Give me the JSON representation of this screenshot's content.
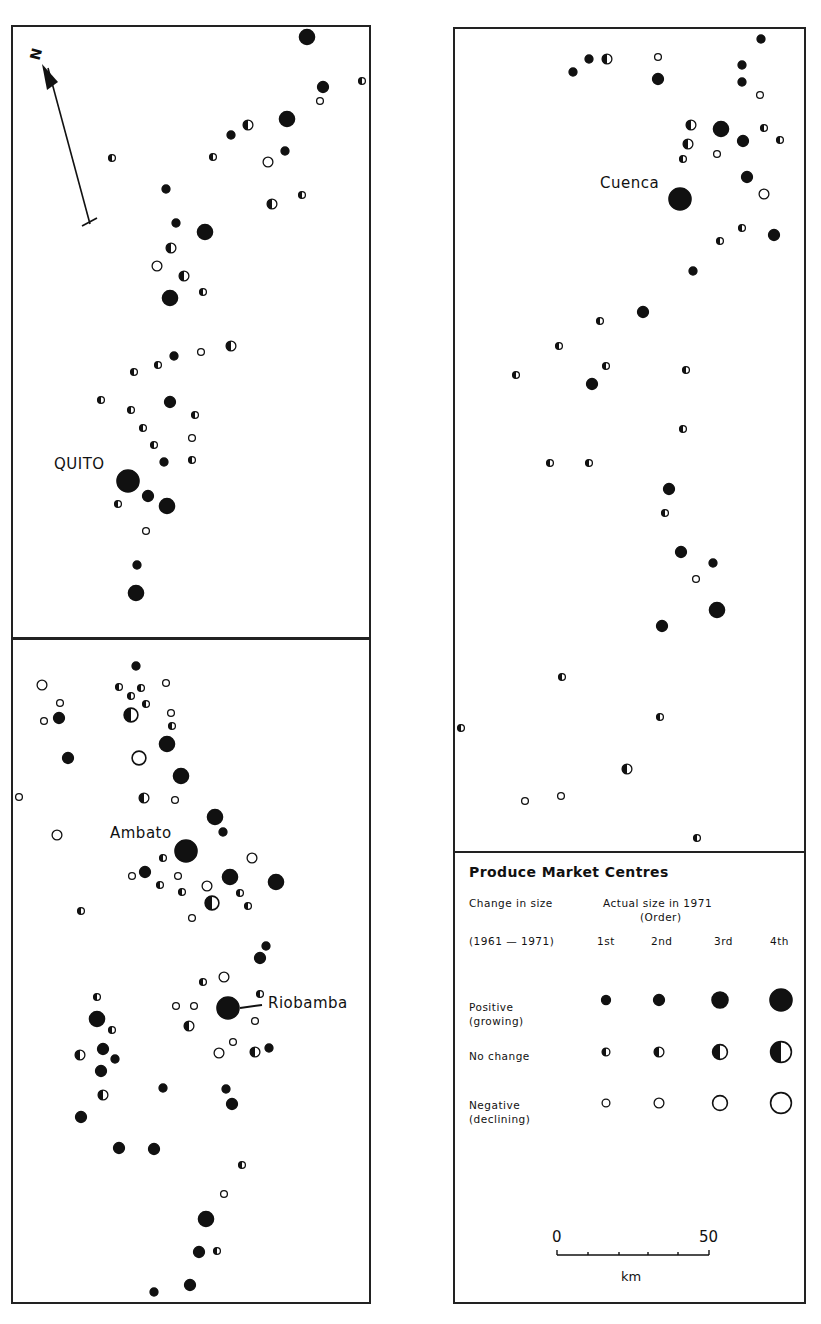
{
  "header": {
    "running_title": "ORIGINS, DEVELOPMENT AND CHANGE"
  },
  "map": {
    "north_label": "N",
    "cities": {
      "quito": "QUITO",
      "cuenca": "Cuenca",
      "ambato": "Ambato",
      "riobamba": "Riobamba"
    }
  },
  "legend": {
    "title": "Produce Market Centres",
    "change_header": "Change in size",
    "period": "(1961 — 1971)",
    "size_header": "Actual size in 1971",
    "size_subheader": "(Order)",
    "orders": [
      "1st",
      "2nd",
      "3rd",
      "4th"
    ],
    "rows": [
      {
        "label": "Positive",
        "sublabel": "(growing)",
        "type": "P"
      },
      {
        "label": "No change",
        "sublabel": "",
        "type": "N"
      },
      {
        "label": "Negative",
        "sublabel": "(declining)",
        "type": "D"
      }
    ],
    "scale": {
      "start": "0",
      "end": "50",
      "unit": "km"
    }
  },
  "colors": {
    "ink": "#111111",
    "paper": "#ffffff",
    "frame": "#222222"
  },
  "chart_data": {
    "type": "scatter",
    "title": "Produce Market Centres",
    "legend_position": "bottom-right panel",
    "encoding": {
      "marker_fill": {
        "P": "Positive (growing)",
        "N": "No change",
        "D": "Negative (declining)"
      },
      "marker_size": {
        "1": "1st order",
        "2": "2nd order",
        "3": "3rd order",
        "4": "4th order"
      }
    },
    "labels": [
      {
        "text": "QUITO",
        "x": 128,
        "y": 481
      },
      {
        "text": "Cuenca",
        "x": 680,
        "y": 199
      },
      {
        "text": "Ambato",
        "x": 186,
        "y": 851
      },
      {
        "text": "Riobamba",
        "x": 228,
        "y": 1008
      }
    ],
    "markers": [
      [
        307,
        37,
        "P",
        3
      ],
      [
        323,
        87,
        "P",
        2
      ],
      [
        362,
        81,
        "N",
        1
      ],
      [
        320,
        101,
        "D",
        1
      ],
      [
        287,
        119,
        "P",
        3
      ],
      [
        248,
        125,
        "N",
        2
      ],
      [
        231,
        135,
        "P",
        1
      ],
      [
        285,
        151,
        "P",
        1
      ],
      [
        268,
        162,
        "D",
        2
      ],
      [
        213,
        157,
        "N",
        1
      ],
      [
        112,
        158,
        "N",
        1
      ],
      [
        302,
        195,
        "N",
        1
      ],
      [
        272,
        204,
        "N",
        2
      ],
      [
        166,
        189,
        "P",
        1
      ],
      [
        176,
        223,
        "P",
        1
      ],
      [
        205,
        232,
        "P",
        3
      ],
      [
        171,
        248,
        "N",
        2
      ],
      [
        157,
        266,
        "D",
        2
      ],
      [
        184,
        276,
        "N",
        2
      ],
      [
        170,
        298,
        "P",
        3
      ],
      [
        203,
        292,
        "N",
        1
      ],
      [
        231,
        346,
        "N",
        2
      ],
      [
        201,
        352,
        "D",
        1
      ],
      [
        174,
        356,
        "P",
        1
      ],
      [
        158,
        365,
        "N",
        1
      ],
      [
        134,
        372,
        "N",
        1
      ],
      [
        101,
        400,
        "N",
        1
      ],
      [
        170,
        402,
        "P",
        2
      ],
      [
        131,
        410,
        "N",
        1
      ],
      [
        195,
        415,
        "N",
        1
      ],
      [
        143,
        428,
        "N",
        1
      ],
      [
        192,
        438,
        "D",
        1
      ],
      [
        154,
        445,
        "N",
        1
      ],
      [
        192,
        460,
        "N",
        1
      ],
      [
        164,
        462,
        "P",
        1
      ],
      [
        128,
        481,
        "P",
        4
      ],
      [
        148,
        496,
        "P",
        2
      ],
      [
        167,
        506,
        "P",
        3
      ],
      [
        118,
        504,
        "N",
        1
      ],
      [
        146,
        531,
        "D",
        1
      ],
      [
        137,
        565,
        "P",
        1
      ],
      [
        136,
        593,
        "P",
        3
      ],
      [
        136,
        666,
        "P",
        1
      ],
      [
        42,
        685,
        "D",
        2
      ],
      [
        119,
        687,
        "N",
        1
      ],
      [
        141,
        688,
        "N",
        1
      ],
      [
        166,
        683,
        "D",
        1
      ],
      [
        60,
        703,
        "D",
        1
      ],
      [
        131,
        696,
        "N",
        1
      ],
      [
        146,
        704,
        "N",
        1
      ],
      [
        44,
        721,
        "D",
        1
      ],
      [
        59,
        718,
        "P",
        2
      ],
      [
        131,
        715,
        "N",
        3
      ],
      [
        171,
        713,
        "D",
        1
      ],
      [
        172,
        726,
        "N",
        1
      ],
      [
        167,
        744,
        "P",
        3
      ],
      [
        68,
        758,
        "P",
        2
      ],
      [
        139,
        758,
        "D",
        3
      ],
      [
        181,
        776,
        "P",
        3
      ],
      [
        19,
        797,
        "D",
        1
      ],
      [
        144,
        798,
        "N",
        2
      ],
      [
        175,
        800,
        "D",
        1
      ],
      [
        215,
        817,
        "P",
        3
      ],
      [
        223,
        832,
        "P",
        1
      ],
      [
        57,
        835,
        "D",
        2
      ],
      [
        186,
        851,
        "P",
        4
      ],
      [
        163,
        858,
        "N",
        1
      ],
      [
        252,
        858,
        "D",
        2
      ],
      [
        145,
        872,
        "P",
        2
      ],
      [
        132,
        876,
        "D",
        1
      ],
      [
        178,
        876,
        "D",
        1
      ],
      [
        230,
        877,
        "P",
        3
      ],
      [
        276,
        882,
        "P",
        3
      ],
      [
        160,
        885,
        "N",
        1
      ],
      [
        207,
        886,
        "D",
        2
      ],
      [
        81,
        911,
        "N",
        1
      ],
      [
        212,
        903,
        "N",
        3
      ],
      [
        182,
        892,
        "N",
        1
      ],
      [
        240,
        893,
        "N",
        1
      ],
      [
        192,
        918,
        "D",
        1
      ],
      [
        248,
        906,
        "N",
        1
      ],
      [
        266,
        946,
        "P",
        1
      ],
      [
        260,
        958,
        "P",
        2
      ],
      [
        203,
        982,
        "N",
        1
      ],
      [
        224,
        977,
        "D",
        2
      ],
      [
        97,
        997,
        "N",
        1
      ],
      [
        176,
        1006,
        "D",
        1
      ],
      [
        194,
        1006,
        "D",
        1
      ],
      [
        228,
        1008,
        "P",
        4
      ],
      [
        260,
        994,
        "N",
        1
      ],
      [
        97,
        1019,
        "P",
        3
      ],
      [
        255,
        1021,
        "D",
        1
      ],
      [
        112,
        1030,
        "N",
        1
      ],
      [
        189,
        1026,
        "N",
        2
      ],
      [
        233,
        1042,
        "D",
        1
      ],
      [
        80,
        1055,
        "N",
        2
      ],
      [
        103,
        1049,
        "P",
        2
      ],
      [
        115,
        1059,
        "P",
        1
      ],
      [
        219,
        1053,
        "D",
        2
      ],
      [
        255,
        1052,
        "N",
        2
      ],
      [
        269,
        1048,
        "P",
        1
      ],
      [
        101,
        1071,
        "P",
        2
      ],
      [
        103,
        1095,
        "N",
        2
      ],
      [
        163,
        1088,
        "P",
        1
      ],
      [
        226,
        1089,
        "P",
        1
      ],
      [
        232,
        1104,
        "P",
        2
      ],
      [
        81,
        1117,
        "P",
        2
      ],
      [
        119,
        1148,
        "P",
        2
      ],
      [
        154,
        1149,
        "P",
        2
      ],
      [
        242,
        1165,
        "N",
        1
      ],
      [
        224,
        1194,
        "D",
        1
      ],
      [
        206,
        1219,
        "P",
        3
      ],
      [
        199,
        1252,
        "P",
        2
      ],
      [
        217,
        1251,
        "N",
        1
      ],
      [
        190,
        1285,
        "P",
        2
      ],
      [
        154,
        1292,
        "P",
        1
      ],
      [
        761,
        39,
        "P",
        1
      ],
      [
        573,
        72,
        "P",
        1
      ],
      [
        589,
        59,
        "P",
        1
      ],
      [
        607,
        59,
        "N",
        2
      ],
      [
        658,
        57,
        "D",
        1
      ],
      [
        742,
        65,
        "P",
        1
      ],
      [
        742,
        82,
        "P",
        1
      ],
      [
        658,
        79,
        "P",
        2
      ],
      [
        760,
        95,
        "D",
        1
      ],
      [
        691,
        125,
        "N",
        2
      ],
      [
        721,
        129,
        "P",
        3
      ],
      [
        764,
        128,
        "N",
        1
      ],
      [
        780,
        140,
        "N",
        1
      ],
      [
        743,
        141,
        "P",
        2
      ],
      [
        688,
        144,
        "N",
        2
      ],
      [
        717,
        154,
        "D",
        1
      ],
      [
        683,
        159,
        "N",
        1
      ],
      [
        747,
        177,
        "P",
        2
      ],
      [
        764,
        194,
        "D",
        2
      ],
      [
        680,
        199,
        "P",
        4
      ],
      [
        742,
        228,
        "N",
        1
      ],
      [
        774,
        235,
        "P",
        2
      ],
      [
        720,
        241,
        "N",
        1
      ],
      [
        693,
        271,
        "P",
        1
      ],
      [
        643,
        312,
        "P",
        2
      ],
      [
        600,
        321,
        "N",
        1
      ],
      [
        559,
        346,
        "N",
        1
      ],
      [
        606,
        366,
        "N",
        1
      ],
      [
        516,
        375,
        "N",
        1
      ],
      [
        592,
        384,
        "P",
        2
      ],
      [
        686,
        370,
        "N",
        1
      ],
      [
        683,
        429,
        "N",
        1
      ],
      [
        550,
        463,
        "N",
        1
      ],
      [
        589,
        463,
        "N",
        1
      ],
      [
        669,
        489,
        "P",
        2
      ],
      [
        665,
        513,
        "N",
        1
      ],
      [
        681,
        552,
        "P",
        2
      ],
      [
        713,
        563,
        "P",
        1
      ],
      [
        696,
        579,
        "D",
        1
      ],
      [
        717,
        610,
        "P",
        3
      ],
      [
        662,
        626,
        "P",
        2
      ],
      [
        562,
        677,
        "N",
        1
      ],
      [
        660,
        717,
        "N",
        1
      ],
      [
        461,
        728,
        "N",
        1
      ],
      [
        627,
        769,
        "N",
        2
      ],
      [
        525,
        801,
        "D",
        1
      ],
      [
        561,
        796,
        "D",
        1
      ],
      [
        697,
        838,
        "N",
        1
      ]
    ]
  }
}
